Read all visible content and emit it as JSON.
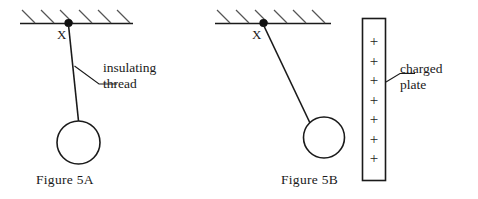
{
  "figures": [
    {
      "id": "figure-5a",
      "caption": "Figure 5A",
      "anchor_label": "X",
      "annotation": {
        "line1": "insulating",
        "line2": "thread"
      },
      "description": "Ball on insulating thread hanging vertically from hatched ceiling at point X"
    },
    {
      "id": "figure-5b",
      "caption": "Figure 5B",
      "anchor_label": "X",
      "annotation": {
        "line1": "charged",
        "line2": "plate"
      },
      "plate": {
        "charge_symbol": "+",
        "charge_count": 7
      },
      "description": "Ball on insulating thread deflected toward a positively charged vertical plate"
    }
  ],
  "style": {
    "stroke_color": "#1a1a1a",
    "background_color": "#ffffff",
    "hatch_color": "#555555"
  }
}
